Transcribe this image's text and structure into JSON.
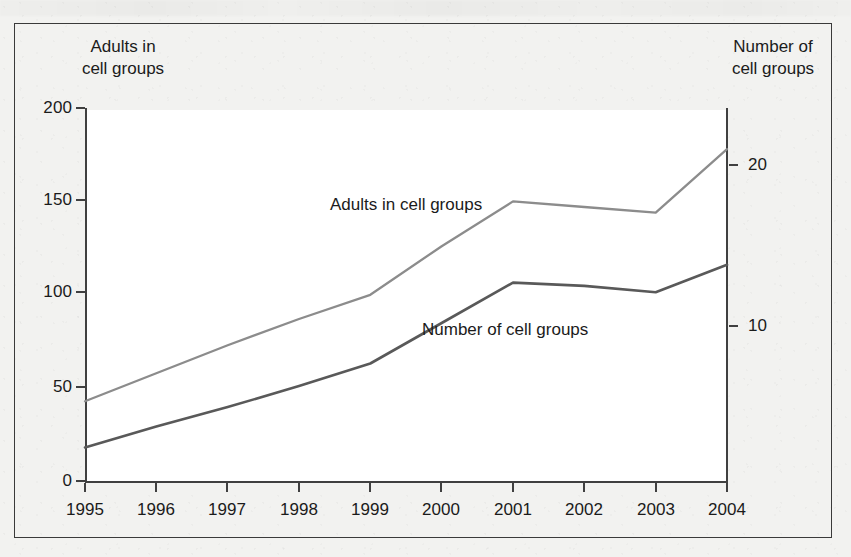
{
  "figure": {
    "background_color": "#f2f2f0",
    "plot_background_color": "#ffffff",
    "frame_color": "#3a3a3a"
  },
  "axis_titles": {
    "left": "Adults in\ncell groups",
    "right": "Number of\ncell groups"
  },
  "series_labels": {
    "adults": "Adults in cell groups",
    "groups": "Number of cell groups"
  },
  "chart_data": {
    "type": "line",
    "title": "",
    "xlabel": "",
    "ylabel": "Adults in cell groups",
    "y2label": "Number of cell groups",
    "grid": false,
    "legend_position": "inline-annotations",
    "x": [
      "1995",
      "1996",
      "1997",
      "1998",
      "1999",
      "2000",
      "2001",
      "2002",
      "2003",
      "2004"
    ],
    "xtick_labels": [
      "1995",
      "1996",
      "1997",
      "1998",
      "1999",
      "2000",
      "2001",
      "2002",
      "2003",
      "2004"
    ],
    "ylim": [
      0,
      200
    ],
    "ytick_labels": [
      "0",
      "50",
      "100",
      "150",
      "200"
    ],
    "ytick_values": [
      0,
      50,
      100,
      150,
      200
    ],
    "y2lim": [
      0,
      23.1
    ],
    "y2tick_labels": [
      "10",
      "20"
    ],
    "y2tick_values": [
      10,
      20
    ],
    "series": [
      {
        "name": "Adults in cell groups",
        "axis": "left",
        "color": "#8c8c8c",
        "values": [
          43,
          58,
          73,
          87,
          100,
          126,
          150,
          147,
          144,
          178
        ]
      },
      {
        "name": "Number of cell groups",
        "axis": "right",
        "color": "#595959",
        "values": [
          2.1,
          3.4,
          4.6,
          5.9,
          7.3,
          9.8,
          12.3,
          12.1,
          11.7,
          13.4
        ],
        "values_in_left_axis_pixels_equivalent": [
          18,
          33,
          48,
          63,
          78,
          98,
          118,
          115,
          112,
          129
        ]
      }
    ]
  }
}
